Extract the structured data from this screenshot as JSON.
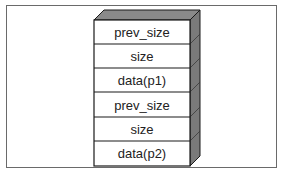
{
  "diagram": {
    "type": "memory-chunk-stack",
    "rows": [
      {
        "label": "prev_size"
      },
      {
        "label": "size"
      },
      {
        "label": "data(p1)"
      },
      {
        "label": "prev_size"
      },
      {
        "label": "size"
      },
      {
        "label": "data(p2)"
      }
    ],
    "colors": {
      "face": "#ffffff",
      "top": "#8a8a8a",
      "side": "#7a7a7a",
      "stroke": "#1a1a1a"
    }
  }
}
